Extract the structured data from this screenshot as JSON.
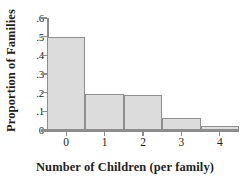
{
  "chart_data": {
    "type": "bar",
    "title": "",
    "xlabel": "Number of Children (per family)",
    "ylabel": "Proportion of Families",
    "categories": [
      "0",
      "1",
      "2",
      "3",
      "4"
    ],
    "values": [
      0.5,
      0.195,
      0.185,
      0.065,
      0.02
    ],
    "ylim": [
      0,
      0.6
    ],
    "xlim": [
      -0.5,
      4.5
    ],
    "ytick_labels": [
      "0",
      ".1",
      ".2",
      ".3",
      ".4",
      ".5",
      ".6"
    ],
    "ytick_values": [
      0,
      0.1,
      0.2,
      0.3,
      0.4,
      0.5,
      0.6
    ],
    "xtick_labels": [
      "0",
      "1",
      "2",
      "3",
      "4"
    ],
    "grid": false,
    "legend": null,
    "bar_fill_color": "#dcdcdc",
    "bar_edge_color": "#8f8f8f",
    "axis_color": "#8c8c8c",
    "text_color": "#231f20",
    "background_color": "#ffffff"
  }
}
